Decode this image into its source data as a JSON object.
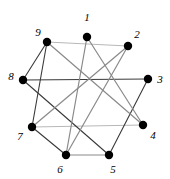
{
  "figure": {
    "title": "",
    "background_color": "#ffffff",
    "width": 170,
    "height": 179
  },
  "chart_data": {
    "type": "diagram",
    "subtype": "graph-drawing",
    "title": "",
    "xlabel": "",
    "ylabel": "",
    "grid": false,
    "legend": null,
    "node_color": "#000000",
    "node_radius": 4.2,
    "edge_colors": {
      "dark": "#3a3a3a",
      "medium": "#8a8a8a",
      "light": "#b8b8b8"
    },
    "nodes": [
      {
        "id": "1",
        "label": "1",
        "x": 87,
        "y": 37,
        "label_x": 87,
        "label_y": 17
      },
      {
        "id": "2",
        "label": "2",
        "x": 128,
        "y": 46,
        "label_x": 137,
        "label_y": 34
      },
      {
        "id": "3",
        "label": "3",
        "x": 148,
        "y": 79,
        "label_x": 160,
        "label_y": 79
      },
      {
        "id": "4",
        "label": "4",
        "x": 143,
        "y": 125,
        "label_x": 153,
        "label_y": 135
      },
      {
        "id": "5",
        "label": "5",
        "x": 109,
        "y": 155,
        "label_x": 113,
        "label_y": 169
      },
      {
        "id": "6",
        "label": "6",
        "x": 66,
        "y": 155,
        "label_x": 60,
        "label_y": 169
      },
      {
        "id": "7",
        "label": "7",
        "x": 32,
        "y": 127,
        "label_x": 20,
        "label_y": 136
      },
      {
        "id": "8",
        "label": "8",
        "x": 23,
        "y": 80,
        "label_x": 11,
        "label_y": 76
      },
      {
        "id": "9",
        "label": "9",
        "x": 47,
        "y": 42,
        "label_x": 38,
        "label_y": 32
      }
    ],
    "edges": [
      {
        "source": "9",
        "target": "2",
        "shade": "light"
      },
      {
        "source": "8",
        "target": "3",
        "shade": "dark"
      },
      {
        "source": "7",
        "target": "4",
        "shade": "light"
      },
      {
        "source": "6",
        "target": "5",
        "shade": "medium"
      },
      {
        "source": "9",
        "target": "8",
        "shade": "dark"
      },
      {
        "source": "9",
        "target": "7",
        "shade": "dark"
      },
      {
        "source": "8",
        "target": "5",
        "shade": "dark"
      },
      {
        "source": "7",
        "target": "6",
        "shade": "dark"
      },
      {
        "source": "3",
        "target": "5",
        "shade": "dark"
      },
      {
        "source": "1",
        "target": "6",
        "shade": "medium"
      },
      {
        "source": "1",
        "target": "4",
        "shade": "medium"
      },
      {
        "source": "9",
        "target": "4",
        "shade": "medium"
      },
      {
        "source": "2",
        "target": "7",
        "shade": "medium"
      },
      {
        "source": "2",
        "target": "6",
        "shade": "medium"
      }
    ],
    "node_count": 9,
    "edge_count": 14
  }
}
